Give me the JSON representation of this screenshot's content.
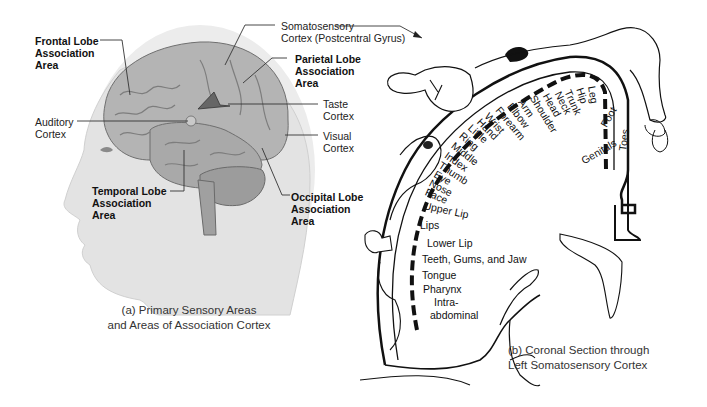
{
  "panel_a": {
    "caption_line1": "(a) Primary Sensory Areas",
    "caption_line2": "and Areas of Association Cortex",
    "labels": {
      "frontal": [
        "Frontal Lobe",
        "Association",
        "Area"
      ],
      "somatosensory": [
        "Somatosensory",
        "Cortex (Postcentral Gyrus)"
      ],
      "parietal": [
        "Parietal Lobe",
        "Association",
        "Area"
      ],
      "auditory": [
        "Auditory",
        "Cortex"
      ],
      "taste": [
        "Taste",
        "Cortex"
      ],
      "visual": [
        "Visual",
        "Cortex"
      ],
      "temporal": [
        "Temporal Lobe",
        "Association",
        "Area"
      ],
      "occipital": [
        "Occipital Lobe",
        "Association",
        "Area"
      ]
    }
  },
  "panel_b": {
    "caption_line1": "(b) Coronal Section through",
    "caption_line2": "Left Somatosensory Cortex",
    "homunculus_labels": [
      "Leg",
      "Hip",
      "Trunk",
      "Neck",
      "Head",
      "Shoulder",
      "Arm",
      "Elbow",
      "Forearm",
      "Wrist",
      "Hand",
      "Little",
      "Ring",
      "Middle",
      "Index",
      "Thumb",
      "Eye",
      "Nose",
      "Face",
      "Upper Lip",
      "Lips",
      "Lower Lip",
      "Teeth, Gums, and Jaw",
      "Tongue",
      "Pharynx",
      "Intra-",
      "abdominal",
      "Foot",
      "Toes",
      "Genitals"
    ]
  },
  "colors": {
    "background": "#ffffff",
    "brain_fill": "#b9b9b9",
    "head_fill": "#e6e6e6",
    "line": "#111111"
  }
}
